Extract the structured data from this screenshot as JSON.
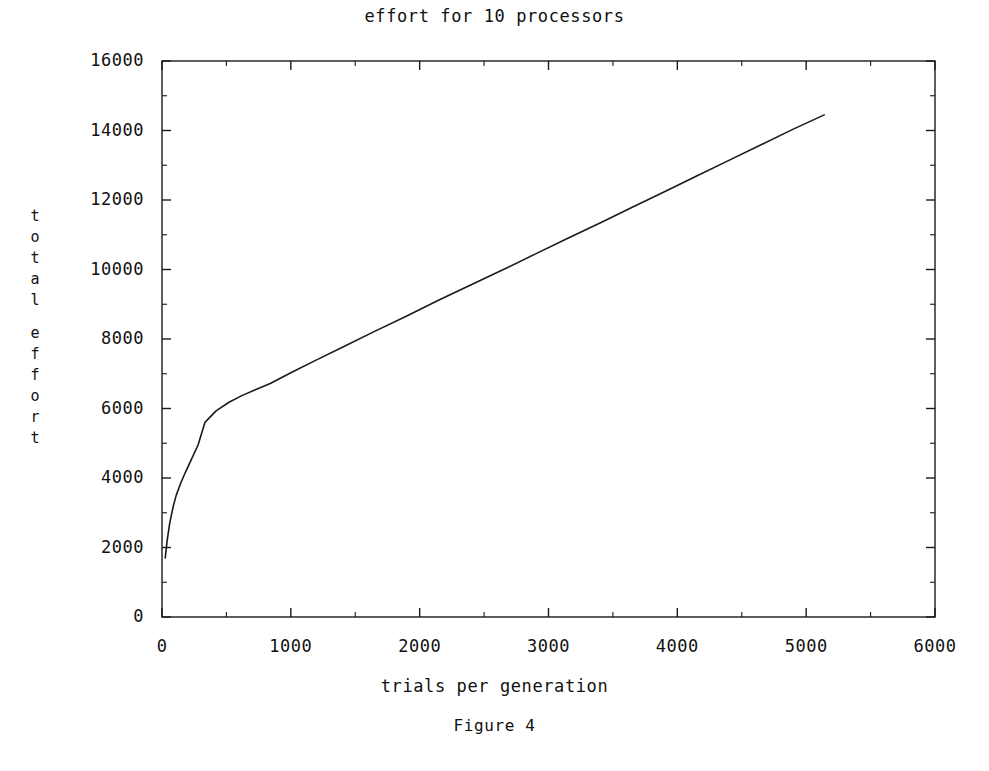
{
  "figure": {
    "caption": "Figure 4"
  },
  "chart_data": {
    "type": "line",
    "title": "effort for 10 processors",
    "xlabel": "trials per generation",
    "ylabel": "total effort",
    "ylabel_chars": [
      "t",
      "o",
      "t",
      "a",
      "l",
      "",
      "e",
      "f",
      "f",
      "o",
      "r",
      "t"
    ],
    "xlim": [
      0,
      6000
    ],
    "ylim": [
      0,
      16000
    ],
    "xticks": [
      0,
      1000,
      2000,
      3000,
      4000,
      5000,
      6000
    ],
    "yticks": [
      0,
      2000,
      4000,
      6000,
      8000,
      10000,
      12000,
      14000,
      16000
    ],
    "xtick_labels": [
      "0",
      "1000",
      "2000",
      "3000",
      "4000",
      "5000",
      "6000"
    ],
    "ytick_labels": [
      "0",
      "2000",
      "4000",
      "6000",
      "8000",
      "10000",
      "12000",
      "14000",
      "16000"
    ],
    "minor_ticks": true,
    "grid": false,
    "legend": false,
    "frame": true,
    "tick_direction": "in",
    "line_color": "#1a1a1a",
    "line_width": 1.6,
    "series": [
      {
        "name": "total effort",
        "x": [
          25,
          40,
          60,
          85,
          110,
          145,
          180,
          230,
          280,
          333,
          420,
          520,
          620,
          720,
          840,
          1000,
          1200,
          1420,
          1650,
          1900,
          2150,
          2400,
          2650,
          2900,
          3150,
          3400,
          3650,
          3900,
          4150,
          4400,
          4650,
          4900,
          5140
        ],
        "y": [
          1700,
          2200,
          2700,
          3150,
          3500,
          3850,
          4150,
          4550,
          4950,
          5600,
          5930,
          6180,
          6370,
          6530,
          6720,
          7030,
          7400,
          7800,
          8220,
          8660,
          9120,
          9560,
          10000,
          10450,
          10900,
          11340,
          11790,
          12240,
          12690,
          13140,
          13590,
          14040,
          14450
        ]
      }
    ]
  },
  "axes_geometry": {
    "left_px": 162,
    "right_px": 935,
    "top_px": 61,
    "bottom_px": 617
  }
}
